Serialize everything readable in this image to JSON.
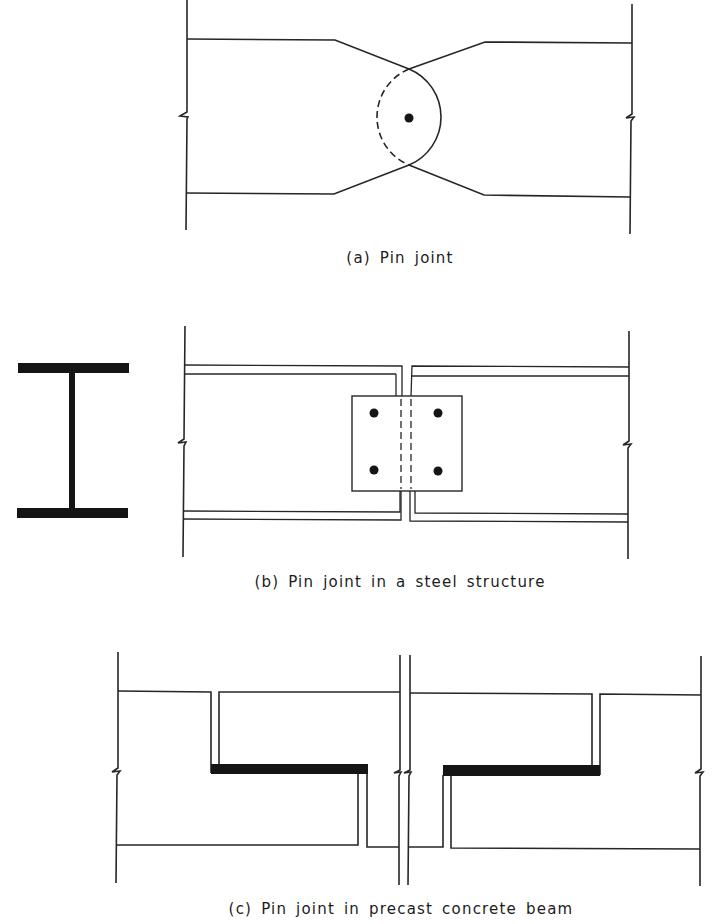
{
  "figure": {
    "panels": [
      {
        "id": "a",
        "caption": "(a) Pin joint",
        "description": "Two tapered members meeting at a pin with circular hinge outline"
      },
      {
        "id": "b",
        "caption": "(b) Pin joint in a steel structure",
        "description": "Two I-beams connected by a bolted web splice plate with 4 bolts; I-section shown at left"
      },
      {
        "id": "c",
        "caption": "(c) Pin joint in precast concrete beam",
        "description": "Two dapped-end precast beams resting on bearing pads at halved joints"
      }
    ],
    "colors": {
      "line": "#262626",
      "fill": "#151515",
      "background": "#ffffff"
    }
  }
}
